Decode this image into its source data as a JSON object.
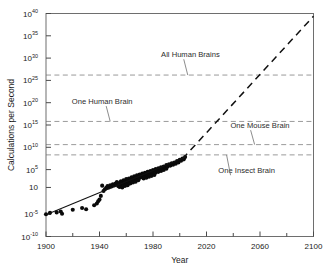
{
  "chart_data": {
    "type": "scatter",
    "title": "",
    "xlabel": "Year",
    "ylabel": "Calculations per Second",
    "xlim": [
      1900,
      2100
    ],
    "ylim_log10": [
      -10,
      40
    ],
    "y_scale": "log",
    "grid": false,
    "legend_position": "none",
    "x_ticks_major": [
      1900,
      1940,
      1980,
      2020,
      2060,
      2100
    ],
    "x_ticks_minor": [
      1920,
      1960,
      2000,
      2040,
      2080
    ],
    "y_tick_labels": [
      "10⁴⁰",
      "10³⁵",
      "10³⁰",
      "10²⁵",
      "10²⁰",
      "10¹⁵",
      "10¹⁰",
      "10⁵",
      "10",
      "10⁻⁵",
      "10⁻¹⁰"
    ],
    "y_tick_bases": [
      "10",
      "10",
      "10",
      "10",
      "10",
      "10",
      "10",
      "10",
      "10",
      "10",
      "10"
    ],
    "y_tick_exponents": [
      "40",
      "35",
      "30",
      "25",
      "20",
      "15",
      "10",
      "5",
      "",
      "-5",
      "-10"
    ],
    "y_tick_log10": [
      40,
      35,
      30,
      25,
      20,
      15,
      10,
      5,
      1,
      -5,
      -10
    ],
    "annotations": [
      {
        "label": "All Human Brains",
        "y_log10": 26.2,
        "text_x": 2008,
        "text_y_log10": 30.3,
        "leader_x": 2003
      },
      {
        "label": "One Human Brain",
        "y_log10": 15.8,
        "text_x": 1942,
        "text_y_log10": 19.8,
        "leader_x": 1945
      },
      {
        "label": "One Mouse Brain",
        "y_log10": 10.6,
        "text_x": 2060,
        "text_y_log10": 14.4,
        "leader_x": 2053
      },
      {
        "label": "One Insect Brain",
        "y_log10": 8.3,
        "text_x": 2050,
        "text_y_log10": 4.3,
        "leader_x": 2038
      }
    ],
    "reference_lines_note": "horizontal dashed brain-capacity thresholds",
    "series": [
      {
        "name": "Computing devices (historical)",
        "style": "points",
        "points": [
          [
            1900,
            -5.0
          ],
          [
            1903,
            -4.7
          ],
          [
            1908,
            -4.6
          ],
          [
            1911,
            -4.4
          ],
          [
            1912,
            -4.9
          ],
          [
            1920,
            -4.0
          ],
          [
            1927,
            -3.6
          ],
          [
            1930,
            -3.9
          ],
          [
            1936,
            -3.0
          ],
          [
            1938,
            -2.6
          ],
          [
            1939,
            -2.1
          ],
          [
            1940,
            -1.7
          ],
          [
            1941,
            -0.9
          ],
          [
            1942,
            1.4
          ],
          [
            1943,
            0.2
          ],
          [
            1944,
            0.6
          ],
          [
            1945,
            0.9
          ],
          [
            1946,
            1.3
          ],
          [
            1947,
            1.0
          ],
          [
            1948,
            1.5
          ],
          [
            1949,
            1.2
          ],
          [
            1950,
            1.7
          ],
          [
            1951,
            1.45
          ],
          [
            1952,
            1.9
          ],
          [
            1953,
            1.6
          ],
          [
            1953,
            2.2
          ],
          [
            1954,
            1.3
          ],
          [
            1955,
            2.0
          ],
          [
            1955,
            1.1
          ],
          [
            1956,
            2.4
          ],
          [
            1956,
            1.5
          ],
          [
            1957,
            2.1
          ],
          [
            1957,
            1.0
          ],
          [
            1958,
            2.6
          ],
          [
            1958,
            1.8
          ],
          [
            1959,
            2.3
          ],
          [
            1959,
            1.35
          ],
          [
            1960,
            2.9
          ],
          [
            1960,
            2.0
          ],
          [
            1961,
            2.5
          ],
          [
            1961,
            1.5
          ],
          [
            1962,
            3.0
          ],
          [
            1962,
            2.2
          ],
          [
            1963,
            2.7
          ],
          [
            1963,
            1.9
          ],
          [
            1964,
            3.3
          ],
          [
            1964,
            2.4
          ],
          [
            1965,
            3.0
          ],
          [
            1965,
            2.1
          ],
          [
            1966,
            3.5
          ],
          [
            1966,
            2.7
          ],
          [
            1967,
            3.2
          ],
          [
            1967,
            2.3
          ],
          [
            1968,
            3.7
          ],
          [
            1968,
            2.9
          ],
          [
            1969,
            3.4
          ],
          [
            1969,
            2.6
          ],
          [
            1970,
            3.9
          ],
          [
            1970,
            3.1
          ],
          [
            1971,
            3.6
          ],
          [
            1972,
            4.1
          ],
          [
            1972,
            3.3
          ],
          [
            1973,
            3.8
          ],
          [
            1973,
            3.0
          ],
          [
            1974,
            4.3
          ],
          [
            1974,
            3.5
          ],
          [
            1975,
            4.0
          ],
          [
            1975,
            3.2
          ],
          [
            1976,
            4.5
          ],
          [
            1976,
            3.7
          ],
          [
            1977,
            4.2
          ],
          [
            1977,
            3.4
          ],
          [
            1978,
            4.7
          ],
          [
            1978,
            3.9
          ],
          [
            1979,
            4.4
          ],
          [
            1979,
            3.6
          ],
          [
            1980,
            4.9
          ],
          [
            1980,
            4.1
          ],
          [
            1981,
            4.6
          ],
          [
            1981,
            3.8
          ],
          [
            1982,
            5.1
          ],
          [
            1982,
            4.3
          ],
          [
            1983,
            4.8
          ],
          [
            1984,
            5.3
          ],
          [
            1984,
            4.5
          ],
          [
            1985,
            5.0
          ],
          [
            1986,
            5.5
          ],
          [
            1986,
            4.7
          ],
          [
            1987,
            5.2
          ],
          [
            1988,
            5.7
          ],
          [
            1988,
            4.9
          ],
          [
            1989,
            5.4
          ],
          [
            1990,
            6.0
          ],
          [
            1990,
            5.2
          ],
          [
            1991,
            5.7
          ],
          [
            1992,
            6.2
          ],
          [
            1993,
            5.9
          ],
          [
            1994,
            6.4
          ],
          [
            1995,
            6.1
          ],
          [
            1996,
            6.6
          ],
          [
            1997,
            6.3
          ],
          [
            1998,
            6.9
          ],
          [
            1999,
            6.6
          ],
          [
            2000,
            7.2
          ],
          [
            2001,
            7.0
          ],
          [
            2002,
            7.5
          ],
          [
            2003,
            7.3
          ],
          [
            2004,
            7.8
          ]
        ]
      },
      {
        "name": "Fitted trend (historical)",
        "style": "solid-line",
        "points": [
          [
            1900,
            -5.1
          ],
          [
            2005,
            7.9
          ]
        ]
      },
      {
        "name": "Extrapolated projection",
        "style": "dashed-line",
        "points": [
          [
            2002,
            7.4
          ],
          [
            2100,
            39.4
          ]
        ]
      }
    ]
  },
  "figure": {
    "background": "#ffffff",
    "frame_color": "#6e6e6e",
    "refline_color": "#9a9a9a",
    "point_color": "#0a0a0a",
    "trend_color": "#111111"
  }
}
